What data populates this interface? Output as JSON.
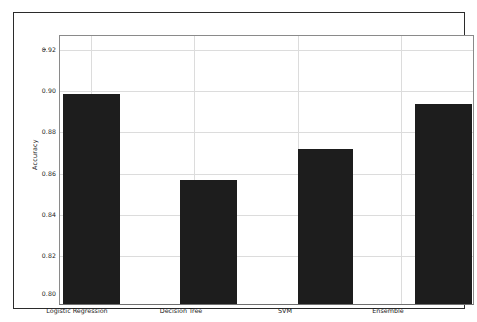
{
  "chart_data": {
    "type": "bar",
    "title": "",
    "xlabel": "",
    "ylabel": "Accuracy",
    "categories": [
      "Logistic Regression",
      "Decision Tree",
      "SVM",
      "Ensemble"
    ],
    "values": [
      0.902,
      0.86,
      0.875,
      0.897
    ],
    "ylim": [
      0.8,
      0.93
    ],
    "yticks": [
      "0.80",
      "0.82",
      "0.84",
      "0.86",
      "0.88",
      "0.90",
      "0.92"
    ],
    "ytick_values": [
      0.8,
      0.82,
      0.84,
      0.86,
      0.88,
      0.9,
      0.92
    ],
    "grid": true,
    "legend": "none",
    "bar_color": "#1d1d1d",
    "grid_color": "#dcdcdc",
    "axes_color": "#8a8a8a",
    "background_color": "#ffffff",
    "frame_color": "#2b2b2b"
  },
  "figure": {
    "axis_label_y": "Accuracy",
    "tick_labels_y": [
      "0.92",
      "0.90",
      "0.88",
      "0.86",
      "0.84",
      "0.82",
      "0.80"
    ],
    "tick_labels_x": [
      "Logistic Regression",
      "Decision Tree",
      "SVM",
      "Ensemble"
    ]
  }
}
